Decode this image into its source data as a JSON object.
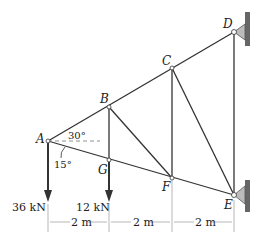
{
  "diagram": {
    "type": "truss",
    "nodes": {
      "A": "A",
      "B": "B",
      "C": "C",
      "D": "D",
      "E": "E",
      "F": "F",
      "G": "G"
    },
    "angles": {
      "upper": "30°",
      "lower": "15°"
    },
    "loads": [
      {
        "node": "A",
        "label": "36 kN"
      },
      {
        "node": "G",
        "label": "12 kN"
      }
    ],
    "dimensions": [
      "2 m",
      "2 m",
      "2 m"
    ],
    "colors": {
      "line": "#333333",
      "support": "#b0b0b0",
      "wall": "#555555"
    }
  }
}
